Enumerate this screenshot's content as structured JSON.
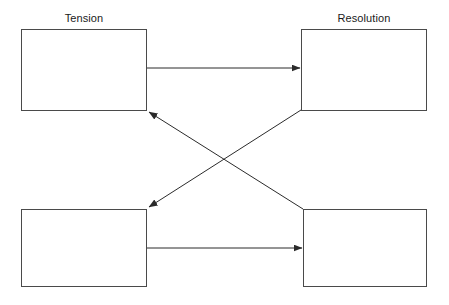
{
  "diagram": {
    "background_color": "#ffffff",
    "box_border_color": "#4a4a4a",
    "edge_color": "#2b2b2b",
    "text_color": "#1a1a1a",
    "nodes": [
      {
        "id": "top-left",
        "label": "Tension",
        "label_position": "above",
        "text": "",
        "x": 21,
        "y": 29,
        "width": 126,
        "height": 82
      },
      {
        "id": "top-right",
        "label": "Resolution",
        "label_position": "above",
        "text": "",
        "x": 301,
        "y": 29,
        "width": 126,
        "height": 82
      },
      {
        "id": "bottom-left",
        "label": "",
        "label_position": "above",
        "text": "",
        "x": 21,
        "y": 209,
        "width": 126,
        "height": 78
      },
      {
        "id": "bottom-right",
        "label": "",
        "label_position": "above",
        "text": "",
        "x": 303,
        "y": 209,
        "width": 124,
        "height": 78
      }
    ],
    "edges": [
      {
        "id": "top-horizontal",
        "from": "top-left",
        "to": "top-right",
        "direction": "right",
        "x1": 147,
        "y1": 68,
        "x2": 300,
        "y2": 68,
        "arrow_at": "end"
      },
      {
        "id": "bottom-horizontal",
        "from": "bottom-left",
        "to": "bottom-right",
        "direction": "right",
        "x1": 147,
        "y1": 248,
        "x2": 302,
        "y2": 248,
        "arrow_at": "end"
      },
      {
        "id": "diagonal-up-left",
        "from": "bottom-right",
        "to": "top-left",
        "direction": "up-left",
        "x1": 303,
        "y1": 209,
        "x2": 149,
        "y2": 112,
        "arrow_at": "end"
      },
      {
        "id": "diagonal-down-left",
        "from": "top-right",
        "to": "bottom-left",
        "direction": "down-left",
        "x1": 301,
        "y1": 110,
        "x2": 149,
        "y2": 207,
        "arrow_at": "end"
      }
    ]
  }
}
